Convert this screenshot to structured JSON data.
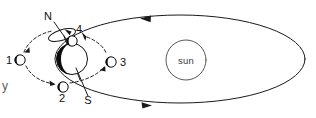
{
  "figure": {
    "background_color": "#ffffff",
    "line_color": "#1a1a1a"
  },
  "sun": {
    "label": "sun"
  },
  "earth": {
    "pole_north_label": "N",
    "pole_south_label": "S"
  },
  "moons": [
    {
      "id": "1",
      "label": "1"
    },
    {
      "id": "2",
      "label": "2"
    },
    {
      "id": "3",
      "label": "3"
    },
    {
      "id": "4",
      "label": "4"
    }
  ],
  "cropped_text": {
    "left_edge": "y"
  }
}
